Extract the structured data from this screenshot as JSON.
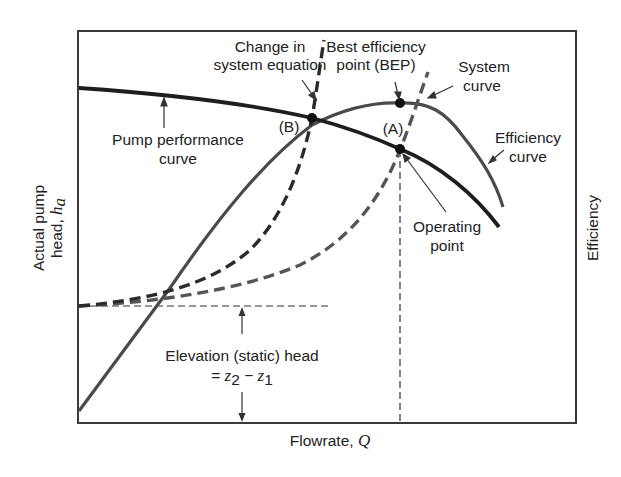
{
  "diagram": {
    "axes": {
      "x_label": "Flowrate, ",
      "x_symbol": "Q",
      "y_left_label_line1": "Actual pump",
      "y_left_label_line2": "head, ",
      "y_left_symbol": "h",
      "y_left_subscript": "a",
      "y_right_label": "Efficiency"
    },
    "annotations": {
      "change_line1": "Change in",
      "change_line2": "system equation",
      "bep_line1": "Best efficiency",
      "bep_line2": "point (BEP)",
      "system_line1": "System",
      "system_line2": "curve",
      "pump_line1": "Pump performance",
      "pump_line2": "curve",
      "efficiency_line1": "Efficiency",
      "efficiency_line2": "curve",
      "operating_line1": "Operating",
      "operating_line2": "point",
      "point_b": "(B)",
      "point_a": "(A)",
      "static_line1": "Elevation (static) head",
      "static_eq_prefix": "= ",
      "static_z2": "z",
      "static_sub2": "2",
      "static_minus": " − ",
      "static_z1": "z",
      "static_sub1": "1"
    },
    "colors": {
      "pump_curve": "#1e1e1e",
      "efficiency_curve": "#4a4a4a",
      "system_curve": "#555555",
      "changed_system_curve": "#2a2a2a",
      "frame": "#3a3a3a"
    }
  }
}
